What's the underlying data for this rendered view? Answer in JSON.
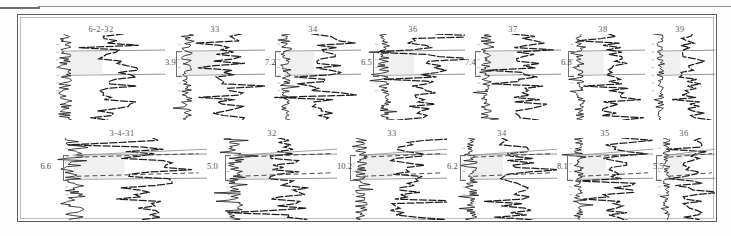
{
  "figure": {
    "kind": "well-log-correlation-plate",
    "frame_color": "#5c5c5c",
    "background": "#ffffff",
    "trace_color": "#1f1f1f",
    "marker_line_color": "#7a7a7a",
    "label_color": "#5e5e5e"
  },
  "rows": [
    {
      "id": "row-1",
      "panels": [
        {
          "header": "6-2-32",
          "value": "",
          "x": 18,
          "width": 128
        },
        {
          "header": "33",
          "value": "3.9",
          "x": 146,
          "width": 100
        },
        {
          "header": "34",
          "value": "7.2",
          "x": 246,
          "width": 96
        },
        {
          "header": "36",
          "value": "6.5",
          "x": 342,
          "width": 104
        },
        {
          "header": "37",
          "value": "7.4",
          "x": 446,
          "width": 96
        },
        {
          "header": "38",
          "value": "6.8",
          "x": 542,
          "width": 84
        },
        {
          "header": "39",
          "value": "",
          "x": 626,
          "width": 70
        }
      ]
    },
    {
      "id": "row-2",
      "panels": [
        {
          "header": "3-4-31",
          "value": "6.6",
          "x": 18,
          "width": 170
        },
        {
          "header": "32",
          "value": "5.0",
          "x": 188,
          "width": 130
        },
        {
          "header": "33",
          "value": "10.2",
          "x": 318,
          "width": 110
        },
        {
          "header": "34",
          "value": "6.2",
          "x": 428,
          "width": 110
        },
        {
          "header": "35",
          "value": "8.1",
          "x": 538,
          "width": 96
        },
        {
          "header": "36",
          "value": "5.5",
          "x": 634,
          "width": 62
        }
      ]
    }
  ],
  "chart_data": {
    "type": "line",
    "title": "",
    "xlabel": "",
    "ylabel": "",
    "series": [
      {
        "name": "6-2-32",
        "row": 1,
        "thickness": null,
        "left_trace": [
          0.5,
          0.58,
          0.44,
          0.62,
          0.4,
          0.55,
          0.48,
          0.66,
          0.42,
          0.57,
          0.5,
          0.63,
          0.45,
          0.6,
          0.52,
          0.47,
          0.58,
          0.41,
          0.56,
          0.49,
          0.62,
          0.44,
          0.53,
          0.47,
          0.59,
          0.43,
          0.55,
          0.5,
          0.61,
          0.46,
          0.52,
          0.57,
          0.44,
          0.58,
          0.5,
          0.47,
          0.55,
          0.43,
          0.59,
          0.51
        ],
        "right_trace": [
          0.48,
          0.62,
          0.38,
          0.7,
          0.35,
          0.58,
          0.75,
          0.3,
          0.66,
          0.42,
          0.8,
          0.25,
          0.6,
          0.5,
          0.72,
          0.33,
          0.55,
          0.64,
          0.4,
          0.68,
          0.36,
          0.58,
          0.47,
          0.62,
          0.41,
          0.55,
          0.66,
          0.38,
          0.59,
          0.48,
          0.63,
          0.44,
          0.57,
          0.51,
          0.6,
          0.45,
          0.56,
          0.49,
          0.58,
          0.47
        ]
      },
      {
        "name": "33",
        "row": 1,
        "thickness": 3.9,
        "marker_top_frac": 0.22,
        "marker_bot_frac": 0.48
      },
      {
        "name": "34",
        "row": 1,
        "thickness": 7.2,
        "marker_top_frac": 0.2,
        "marker_bot_frac": 0.5
      },
      {
        "name": "36",
        "row": 1,
        "thickness": 6.5,
        "marker_top_frac": 0.18,
        "marker_bot_frac": 0.46
      },
      {
        "name": "37",
        "row": 1,
        "thickness": 7.4,
        "marker_top_frac": 0.16,
        "marker_bot_frac": 0.46
      },
      {
        "name": "38",
        "row": 1,
        "thickness": 6.8,
        "marker_top_frac": 0.18,
        "marker_bot_frac": 0.44
      },
      {
        "name": "39",
        "row": 1,
        "thickness": null
      },
      {
        "name": "3-4-31",
        "row": 2,
        "thickness": 6.6,
        "marker_top_frac": 0.26,
        "marker_bot_frac": 0.52
      },
      {
        "name": "32",
        "row": 2,
        "thickness": 5.0,
        "marker_top_frac": 0.24,
        "marker_bot_frac": 0.5
      },
      {
        "name": "33",
        "row": 2,
        "thickness": 10.2,
        "marker_top_frac": 0.22,
        "marker_bot_frac": 0.52
      },
      {
        "name": "34",
        "row": 2,
        "thickness": 6.2,
        "marker_top_frac": 0.22,
        "marker_bot_frac": 0.5
      },
      {
        "name": "35",
        "row": 2,
        "thickness": 8.1,
        "marker_top_frac": 0.2,
        "marker_bot_frac": 0.48
      },
      {
        "name": "36",
        "row": 2,
        "thickness": 5.5,
        "marker_top_frac": 0.22,
        "marker_bot_frac": 0.46
      }
    ]
  }
}
